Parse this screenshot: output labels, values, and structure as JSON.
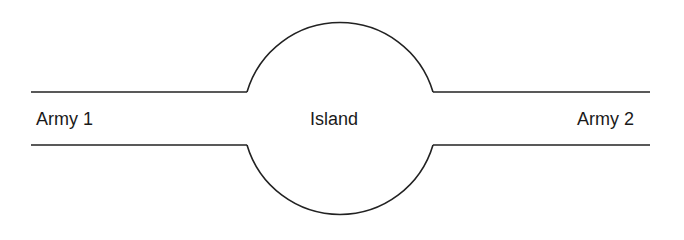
{
  "diagram": {
    "labels": {
      "left": "Army 1",
      "center": "Island",
      "right": "Army 2"
    },
    "colors": {
      "stroke": "#222222",
      "text": "#1a1a1a",
      "background": "#ffffff"
    }
  }
}
